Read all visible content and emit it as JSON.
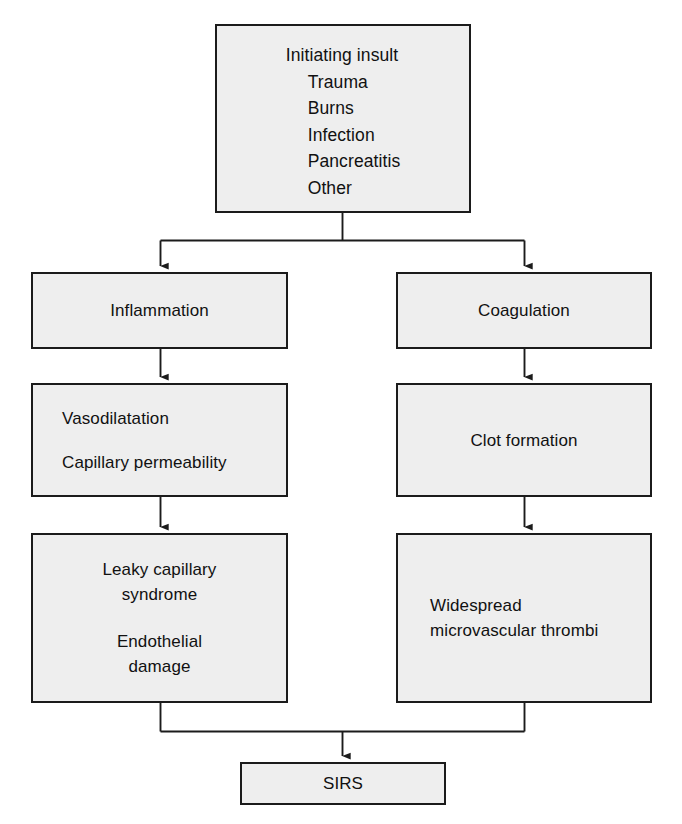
{
  "diagram": {
    "type": "flowchart",
    "colors": {
      "node_fill": "#eeeeee",
      "node_border": "#1b1b1b",
      "connector": "#1b1b1b",
      "text": "#111111",
      "background": "#ffffff"
    },
    "nodes": {
      "initiating_insult": {
        "heading": "Initiating insult",
        "items": [
          "Trauma",
          "Burns",
          "Infection",
          "Pancreatitis",
          "Other"
        ]
      },
      "inflammation": {
        "label": "Inflammation"
      },
      "coagulation": {
        "label": "Coagulation"
      },
      "vasodilatation": {
        "line1": "Vasodilatation",
        "line2": "Capillary permeability"
      },
      "clot_formation": {
        "label": "Clot formation"
      },
      "leaky_capillary": {
        "line1": "Leaky capillary",
        "line2": "syndrome",
        "line3": "Endothelial",
        "line4": "damage"
      },
      "widespread_thrombi": {
        "line1": "Widespread",
        "line2": "microvascular thrombi"
      },
      "sirs": {
        "label": "SIRS"
      }
    },
    "edges": [
      {
        "from": "initiating_insult",
        "to": "inflammation",
        "style": "split-branch-left"
      },
      {
        "from": "initiating_insult",
        "to": "coagulation",
        "style": "split-branch-right"
      },
      {
        "from": "inflammation",
        "to": "vasodilatation",
        "style": "straight-down"
      },
      {
        "from": "coagulation",
        "to": "clot_formation",
        "style": "straight-down"
      },
      {
        "from": "vasodilatation",
        "to": "leaky_capillary",
        "style": "straight-down"
      },
      {
        "from": "clot_formation",
        "to": "widespread_thrombi",
        "style": "straight-down"
      },
      {
        "from": "leaky_capillary",
        "to": "sirs",
        "style": "merge-left"
      },
      {
        "from": "widespread_thrombi",
        "to": "sirs",
        "style": "merge-right"
      }
    ]
  }
}
